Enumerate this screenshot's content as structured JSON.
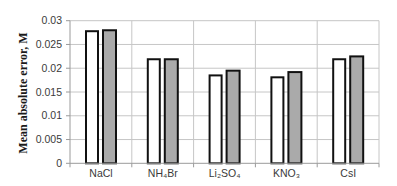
{
  "chart_data": {
    "type": "bar",
    "title": "",
    "xlabel": "",
    "ylabel": "Mean absolute error, M",
    "ylim": [
      0,
      0.03
    ],
    "yticks": [
      "0",
      "0.005",
      "0.01",
      "0.015",
      "0.02",
      "0.025",
      "0.03"
    ],
    "grid": true,
    "legend": "none",
    "categories": [
      "NaCl",
      "NH₄Br",
      "Li₂SO₄",
      "KNO₃",
      "CsI"
    ],
    "series": [
      {
        "name": "",
        "fill": "#ffffff",
        "values": [
          0.028,
          0.0221,
          0.0187,
          0.0183,
          0.0221
        ]
      },
      {
        "name": "",
        "fill": "#aaaaaa",
        "values": [
          0.0282,
          0.0221,
          0.0197,
          0.0194,
          0.0227
        ]
      }
    ]
  }
}
